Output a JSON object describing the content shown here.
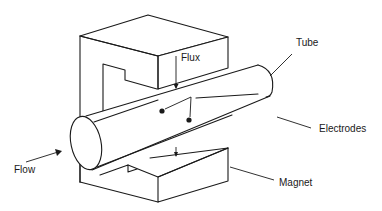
{
  "diagram": {
    "labels": {
      "flux": "Flux",
      "tube": "Tube",
      "electrodes": "Electrodes",
      "flow": "Flow",
      "magnet": "Magnet"
    },
    "colors": {
      "line": "#1a1a1a",
      "background": "#ffffff"
    }
  }
}
